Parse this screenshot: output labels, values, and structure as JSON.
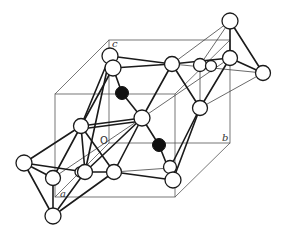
{
  "diagram": {
    "type": "crystal-structure",
    "labels": {
      "a": "a",
      "b": "b",
      "c": "c",
      "origin": "O"
    },
    "colors": {
      "line": "#1a1a1a",
      "cell": "#555555",
      "atom_fill_white": "#ffffff",
      "atom_fill_black": "#111111"
    },
    "atom_types": [
      "open-circle",
      "filled-circle"
    ],
    "filled_atom_count": 2
  }
}
